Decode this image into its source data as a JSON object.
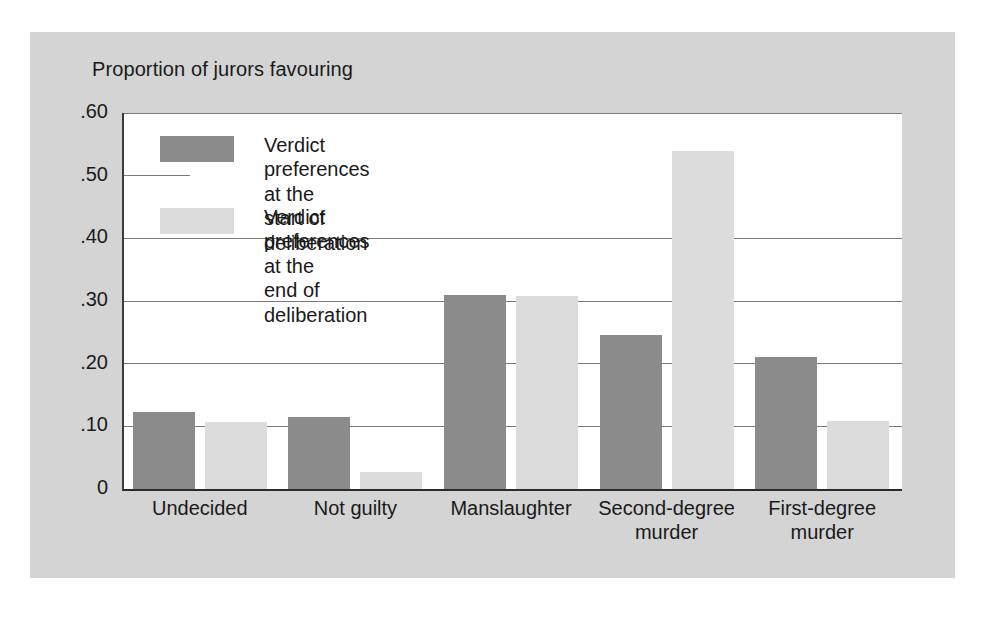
{
  "chart_data": {
    "type": "bar",
    "title": "Proportion of jurors favouring",
    "xlabel": "",
    "ylabel": "Proportion of jurors favouring",
    "ylim": [
      0,
      0.6
    ],
    "grid": true,
    "legend_position": "upper-left-inside",
    "ytick_labels": [
      ".60",
      ".50",
      ".40",
      ".30",
      ".20",
      ".10",
      "0"
    ],
    "ytick_values": [
      0.6,
      0.5,
      0.4,
      0.3,
      0.2,
      0.1,
      0
    ],
    "categories": [
      "Undecided",
      "Not guilty",
      "Manslaughter",
      "Second-degree\nmurder",
      "First-degree\nmurder"
    ],
    "series": [
      {
        "name": "Verdict preferences at the\nstart of deliberation",
        "color": "#8b8b8b",
        "values": [
          0.123,
          0.115,
          0.31,
          0.245,
          0.21
        ]
      },
      {
        "name": "Verdict preferences at the\nend of deliberation",
        "color": "#dcdcdc",
        "values": [
          0.107,
          0.027,
          0.308,
          0.54,
          0.108
        ]
      }
    ]
  },
  "figure": {
    "panel_background": "#d4d4d4",
    "plot_background": "#ffffff",
    "axis_color": "#2b2b2b",
    "gridline_color": "#7a7a7a",
    "text_color": "#1a1a1a"
  }
}
